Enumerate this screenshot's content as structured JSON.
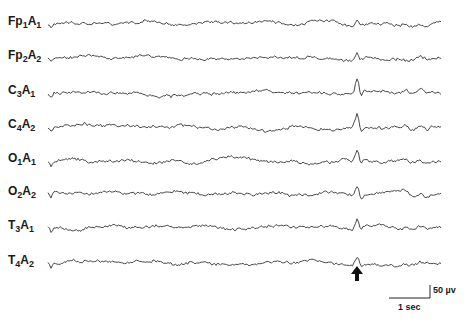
{
  "chart_data": {
    "type": "line",
    "title": "",
    "xlabel": "",
    "ylabel": "",
    "grid": false,
    "legend": "none",
    "channels": [
      {
        "name": "Fp1A1",
        "base": "Fp",
        "sub1": "1",
        "mid": "A",
        "sub2": "1",
        "baseline_y": 24,
        "spike": 0.4
      },
      {
        "name": "Fp2A2",
        "base": "Fp",
        "sub1": "2",
        "mid": "A",
        "sub2": "2",
        "baseline_y": 58,
        "spike": 0.4
      },
      {
        "name": "C3A1",
        "base": "C",
        "sub1": "3",
        "mid": "A",
        "sub2": "1",
        "baseline_y": 93,
        "spike": 1.0
      },
      {
        "name": "C4A2",
        "base": "C",
        "sub1": "4",
        "mid": "A",
        "sub2": "2",
        "baseline_y": 127,
        "spike": 1.0
      },
      {
        "name": "O1A1",
        "base": "O",
        "sub1": "1",
        "mid": "A",
        "sub2": "1",
        "baseline_y": 161,
        "spike": 0.7
      },
      {
        "name": "O2A2",
        "base": "O",
        "sub1": "2",
        "mid": "A",
        "sub2": "2",
        "baseline_y": 194,
        "spike": 0.75
      },
      {
        "name": "T3A1",
        "base": "T",
        "sub1": "3",
        "mid": "A",
        "sub2": "1",
        "baseline_y": 228,
        "spike": 0.65
      },
      {
        "name": "T4A2",
        "base": "T",
        "sub1": "4",
        "mid": "A",
        "sub2": "2",
        "baseline_y": 263,
        "spike": 0.45
      }
    ],
    "trace_x_range": [
      48,
      441
    ],
    "event_marker": {
      "x": 357,
      "label": "arrow"
    },
    "scale_bar": {
      "time_label": "1 sec",
      "amplitude_label": "50 µv"
    }
  },
  "annotations": {
    "arrow_icon": "up-arrow",
    "time_scale": "1 sec",
    "amplitude_scale": "50 µv"
  }
}
